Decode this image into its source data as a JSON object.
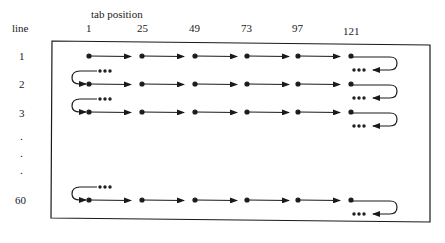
{
  "header": {
    "axis_title": "tab position",
    "row_axis_label": "line"
  },
  "tab_positions": [
    "1",
    "25",
    "49",
    "73",
    "97",
    "121"
  ],
  "lines": [
    {
      "label": "1"
    },
    {
      "label": "2"
    },
    {
      "label": "3"
    },
    {
      "label": "."
    },
    {
      "label": "."
    },
    {
      "label": "."
    },
    {
      "label": "60"
    }
  ],
  "continuation_marker": "...",
  "colors": {
    "ink": "#1a1a1a",
    "background": "#ffffff"
  }
}
